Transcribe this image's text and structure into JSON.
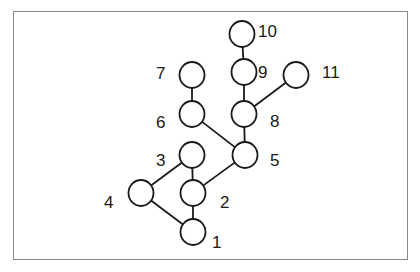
{
  "diagram": {
    "type": "tree",
    "nodes": [
      {
        "id": "1",
        "label": "1",
        "cx": 193,
        "cy": 232,
        "lx": 212,
        "ly": 248
      },
      {
        "id": "2",
        "label": "2",
        "cx": 193,
        "cy": 193,
        "lx": 220,
        "ly": 208
      },
      {
        "id": "3",
        "label": "3",
        "cx": 192,
        "cy": 155,
        "lx": 156,
        "ly": 166
      },
      {
        "id": "4",
        "label": "4",
        "cx": 141,
        "cy": 193,
        "lx": 104,
        "ly": 208
      },
      {
        "id": "5",
        "label": "5",
        "cx": 245,
        "cy": 155,
        "lx": 270,
        "ly": 166
      },
      {
        "id": "6",
        "label": "6",
        "cx": 192,
        "cy": 114,
        "lx": 156,
        "ly": 128
      },
      {
        "id": "7",
        "label": "7",
        "cx": 192,
        "cy": 75,
        "lx": 156,
        "ly": 79
      },
      {
        "id": "8",
        "label": "8",
        "cx": 244,
        "cy": 114,
        "lx": 270,
        "ly": 127
      },
      {
        "id": "9",
        "label": "9",
        "cx": 244,
        "cy": 72,
        "lx": 258,
        "ly": 78
      },
      {
        "id": "10",
        "label": "10",
        "cx": 242,
        "cy": 34,
        "lx": 258,
        "ly": 37
      },
      {
        "id": "11",
        "label": "11",
        "cx": 296,
        "cy": 75,
        "lx": 322,
        "ly": 78
      }
    ],
    "edges": [
      {
        "from": "1",
        "to": "2"
      },
      {
        "from": "1",
        "to": "4"
      },
      {
        "from": "2",
        "to": "3"
      },
      {
        "from": "2",
        "to": "5"
      },
      {
        "from": "4",
        "to": "3"
      },
      {
        "from": "5",
        "to": "6"
      },
      {
        "from": "5",
        "to": "8"
      },
      {
        "from": "6",
        "to": "7"
      },
      {
        "from": "8",
        "to": "9"
      },
      {
        "from": "8",
        "to": "11"
      },
      {
        "from": "9",
        "to": "10"
      }
    ],
    "node_radius": 12.5,
    "colors": {
      "stroke": "#1a1a1a",
      "frame": "#8a8a8a",
      "background": "#ffffff"
    }
  }
}
